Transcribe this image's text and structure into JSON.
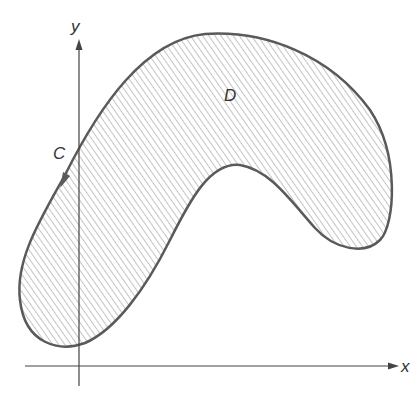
{
  "figure": {
    "type": "region-diagram",
    "labels": {
      "x_axis": "x",
      "y_axis": "y",
      "curve": "C",
      "region": "D"
    },
    "colors": {
      "curve": "#5a5a5a",
      "axis": "#444444",
      "hatch": "#8a8a8a",
      "background": "#ffffff"
    }
  }
}
